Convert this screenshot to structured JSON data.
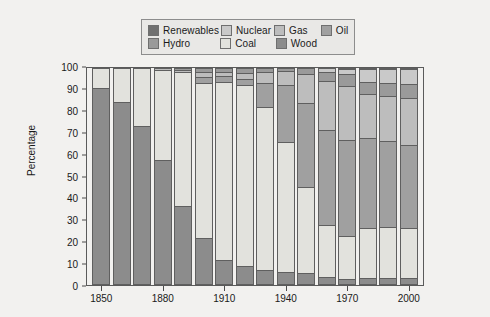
{
  "chart_data": {
    "type": "bar",
    "title": "",
    "subtitle": "",
    "xlabel": "",
    "ylabel": "Percentage",
    "ylim": [
      0,
      100
    ],
    "yticks": [
      0,
      10,
      20,
      30,
      40,
      50,
      60,
      70,
      80,
      90,
      100
    ],
    "xticks": [
      "1850",
      "1880",
      "1910",
      "1940",
      "1970",
      "2000"
    ],
    "grid": false,
    "stacked": true,
    "stack_order_bottom_to_top": [
      "Wood",
      "Coal",
      "Oil",
      "Gas",
      "Hydro",
      "Nuclear",
      "Renewables"
    ],
    "legend_position": "top",
    "categories": [
      "1850",
      "1860",
      "1870",
      "1880",
      "1890",
      "1900",
      "1910",
      "1920",
      "1930",
      "1940",
      "1950",
      "1960",
      "1970",
      "1980",
      "1990",
      "2000"
    ],
    "series": [
      {
        "name": "Wood",
        "color": "#8c8c8c",
        "values": [
          90.5,
          84.0,
          73.0,
          57.0,
          36.0,
          21.0,
          10.5,
          8.0,
          6.0,
          5.0,
          4.5,
          3.0,
          2.0,
          2.5,
          2.5,
          2.5
        ]
      },
      {
        "name": "Coal",
        "color": "#e2e2dd",
        "values": [
          9.5,
          16.0,
          27.0,
          42.0,
          62.0,
          72.0,
          83.0,
          84.0,
          76.0,
          60.5,
          40.0,
          24.0,
          20.0,
          23.0,
          23.5,
          23.0
        ]
      },
      {
        "name": "Oil",
        "color": "#a0a0a0",
        "values": [
          0.0,
          0.0,
          0.0,
          0.0,
          0.0,
          3.0,
          3.0,
          3.0,
          11.0,
          26.5,
          39.0,
          44.0,
          44.5,
          42.0,
          40.0,
          38.5
        ]
      },
      {
        "name": "Gas",
        "color": "#bdbdbd",
        "values": [
          0.0,
          0.0,
          0.0,
          1.0,
          1.0,
          2.0,
          1.5,
          2.5,
          5.0,
          6.5,
          13.5,
          23.0,
          25.0,
          20.5,
          21.0,
          22.0
        ]
      },
      {
        "name": "Hydro",
        "color": "#9a9a9a",
        "values": [
          0.0,
          0.0,
          0.0,
          0.0,
          1.0,
          2.0,
          2.0,
          2.5,
          2.0,
          1.5,
          3.0,
          4.0,
          5.5,
          5.5,
          6.0,
          6.5
        ]
      },
      {
        "name": "Nuclear",
        "color": "#c9c9c9",
        "values": [
          0.0,
          0.0,
          0.0,
          0.0,
          0.0,
          0.0,
          0.0,
          0.0,
          0.0,
          0.0,
          0.0,
          2.0,
          2.5,
          6.0,
          6.5,
          7.0
        ]
      },
      {
        "name": "Renewables",
        "color": "#707070",
        "values": [
          0.0,
          0.0,
          0.0,
          0.0,
          0.0,
          0.0,
          0.0,
          0.0,
          0.0,
          0.0,
          0.0,
          0.0,
          0.5,
          0.5,
          0.5,
          0.5
        ]
      }
    ]
  },
  "legend": {
    "rows": [
      [
        {
          "label": "Renewables",
          "color": "#707070",
          "swatch_name": "legend-swatch-renewables"
        },
        {
          "label": "Nuclear",
          "color": "#c9c9c9",
          "swatch_name": "legend-swatch-nuclear"
        },
        {
          "label": "Gas",
          "color": "#bdbdbd",
          "swatch_name": "legend-swatch-gas"
        },
        {
          "label": "Oil",
          "color": "#a0a0a0",
          "swatch_name": "legend-swatch-oil"
        }
      ],
      [
        {
          "label": "Hydro",
          "color": "#9a9a9a",
          "swatch_name": "legend-swatch-hydro"
        },
        {
          "label": "Coal",
          "color": "#e2e2dd",
          "swatch_name": "legend-swatch-coal"
        },
        {
          "label": "Wood",
          "color": "#8c8c8c",
          "swatch_name": "legend-swatch-wood"
        }
      ]
    ],
    "row_item_offsets": [
      [
        0,
        72,
        128,
        172
      ],
      [
        0,
        72,
        128
      ]
    ]
  },
  "axis": {
    "y_label": "Percentage",
    "y_ticks": [
      "100",
      "90",
      "80",
      "70",
      "60",
      "50",
      "40",
      "30",
      "20",
      "10",
      "0"
    ],
    "x_ticks": [
      {
        "label": "1850",
        "bar_index": 0
      },
      {
        "label": "1880",
        "bar_index": 3
      },
      {
        "label": "1910",
        "bar_index": 6
      },
      {
        "label": "1940",
        "bar_index": 9
      },
      {
        "label": "1970",
        "bar_index": 12
      },
      {
        "label": "2000",
        "bar_index": 15
      }
    ]
  },
  "colors": {
    "figure_background": "#f2f1ef",
    "plot_background": "#f2f1ef",
    "axis_line": "#5a5a5a",
    "text": "#1a1a1a",
    "legend_background": "#e9e8e6",
    "legend_border": "#8d8d8d"
  }
}
